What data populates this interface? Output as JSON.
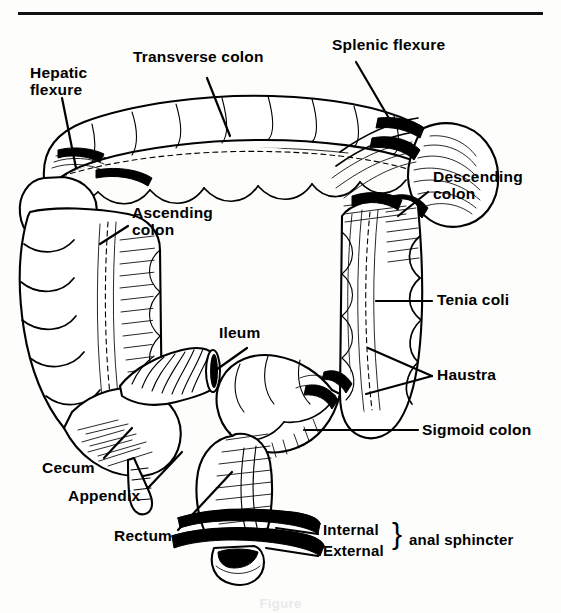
{
  "figure": {
    "domain": "anatomical-line-drawing",
    "caption": "Figure",
    "background_color": "#fdfdfc",
    "ink_color": "#000000",
    "top_rule": {
      "visible": true,
      "x1": 18,
      "x2": 543,
      "y": 13,
      "thickness": 3
    }
  },
  "labels": [
    {
      "id": "hepatic-flexure",
      "text_line1": "Hepatic",
      "text_line2": "flexure",
      "x": 30,
      "y": 72
    },
    {
      "id": "transverse-colon",
      "text_line1": "Transverse colon",
      "text_line2": "",
      "x": 133,
      "y": 55
    },
    {
      "id": "splenic-flexure",
      "text_line1": "Splenic flexure",
      "text_line2": "",
      "x": 332,
      "y": 42
    },
    {
      "id": "descending-colon",
      "text_line1": "Descending",
      "text_line2": "colon",
      "x": 433,
      "y": 176
    },
    {
      "id": "ascending-colon",
      "text_line1": "Ascending",
      "text_line2": "colon",
      "x": 132,
      "y": 212
    },
    {
      "id": "tenia-coli",
      "text_line1": "Tenia coli",
      "text_line2": "",
      "x": 437,
      "y": 295
    },
    {
      "id": "ileum",
      "text_line1": "Ileum",
      "text_line2": "",
      "x": 219,
      "y": 331
    },
    {
      "id": "haustra",
      "text_line1": "Haustra",
      "text_line2": "",
      "x": 437,
      "y": 370
    },
    {
      "id": "sigmoid-colon",
      "text_line1": "Sigmoid colon",
      "text_line2": "",
      "x": 422,
      "y": 425
    },
    {
      "id": "cecum",
      "text_line1": "Cecum",
      "text_line2": "",
      "x": 42,
      "y": 467
    },
    {
      "id": "appendix",
      "text_line1": "Appendix",
      "text_line2": "",
      "x": 68,
      "y": 495
    },
    {
      "id": "rectum",
      "text_line1": "Rectum",
      "text_line2": "",
      "x": 114,
      "y": 535
    },
    {
      "id": "internal-sphincter",
      "text_line1": "Internal",
      "text_line2": "",
      "x": 323,
      "y": 528
    },
    {
      "id": "external-sphincter",
      "text_line1": "External",
      "text_line2": "",
      "x": 323,
      "y": 549
    },
    {
      "id": "anal-sphincter-group",
      "text_line1": "anal sphincter",
      "text_line2": "",
      "x": 409,
      "y": 539
    }
  ],
  "brace": {
    "glyph": "}",
    "x": 392,
    "y": 527
  },
  "structures": [
    "ascending colon",
    "hepatic flexure",
    "transverse colon",
    "splenic flexure",
    "descending colon",
    "sigmoid colon",
    "rectum",
    "cecum",
    "appendix",
    "ileum",
    "tenia coli",
    "haustra",
    "internal anal sphincter",
    "external anal sphincter"
  ]
}
